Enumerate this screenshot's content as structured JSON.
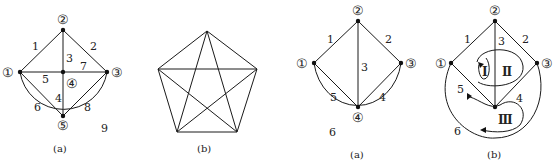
{
  "figures": [
    {
      "caption": "(a)",
      "nodes": [
        "①",
        "②",
        "③",
        "④",
        "⑤"
      ],
      "edges": [
        "1",
        "2",
        "3",
        "4",
        "5",
        "6",
        "7",
        "8",
        "9"
      ]
    },
    {
      "caption": "(b)",
      "description": "complete graph K5 (pentagon with pentagram)"
    },
    {
      "caption": "(a)",
      "nodes": [
        "①",
        "②",
        "③",
        "④"
      ],
      "edges": [
        "1",
        "2",
        "3",
        "4",
        "5",
        "6"
      ]
    },
    {
      "caption": "(b)",
      "nodes": [
        "①",
        "②",
        "③"
      ],
      "edges": [
        "1",
        "2",
        "3",
        "4",
        "5",
        "6"
      ],
      "loops": [
        "Ⅰ",
        "Ⅱ",
        "Ⅲ"
      ]
    }
  ]
}
